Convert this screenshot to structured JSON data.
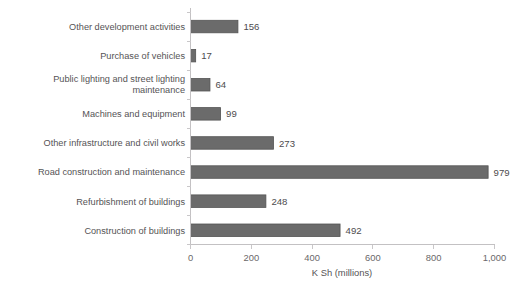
{
  "chart_data": {
    "type": "bar",
    "orientation": "horizontal",
    "title": "",
    "xlabel": "K Sh (millions)",
    "ylabel": "",
    "xlim": [
      0,
      1000
    ],
    "xticks": [
      0,
      200,
      400,
      600,
      800,
      1000
    ],
    "xtick_labels": [
      "0",
      "200",
      "400",
      "600",
      "800",
      "1,000"
    ],
    "grid": false,
    "legend": false,
    "bar_color": "#6b6b6b",
    "categories": [
      "Other development activities",
      "Purchase of vehicles",
      "Public lighting and street lighting maintenance",
      "Machines and equipment",
      "Other infrastructure and civil works",
      "Road construction and maintenance",
      "Refurbishment of buildings",
      "Construction of buildings"
    ],
    "values": [
      156,
      17,
      64,
      99,
      273,
      979,
      248,
      492
    ],
    "value_labels": [
      "156",
      "17",
      "64",
      "99",
      "273",
      "979",
      "248",
      "492"
    ]
  }
}
